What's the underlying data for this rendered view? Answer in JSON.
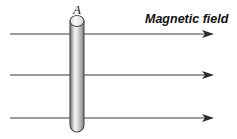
{
  "figure": {
    "type": "physics-diagram",
    "background_color": "#ffffff"
  },
  "labels": {
    "conductor_label": "A",
    "field_label": "Magnetic field"
  },
  "conductor": {
    "name": "vertical-cylindrical-rod",
    "shape": "cylinder",
    "outline_color": "#4a4a4a",
    "body_gradient": [
      "#6e6e6e",
      "#f2f2f2",
      "#bdbdbd",
      "#8a8a8a"
    ],
    "x_left": 70,
    "x_right": 84,
    "y_top": 21,
    "y_bottom": 132,
    "cap_rx": 7,
    "cap_ry": 5.5
  },
  "field_lines": {
    "count": 3,
    "color": "#3b3b3b",
    "direction": "left-to-right",
    "x_start": 10,
    "x_end": 212,
    "y_positions": [
      34,
      75,
      118
    ],
    "arrowhead_color": "#2a2a2a"
  }
}
